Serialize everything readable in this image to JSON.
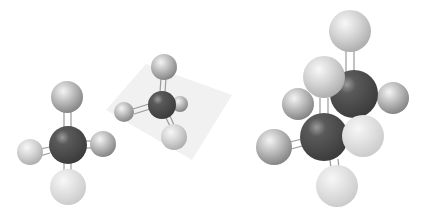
{
  "scene": {
    "description": "Ball-and-stick molecular models on white background",
    "background": "#ffffff",
    "colors": {
      "carbon": "#4a4a4a",
      "hydrogen": "#b5b5b5",
      "hydrogen_pale": "#dcdcdc",
      "bond": "#9a9a9a",
      "plane": "#efefef"
    },
    "molecules": [
      {
        "name": "methane-front-view",
        "atoms": [
          {
            "el": "H",
            "x": 67,
            "y": 97,
            "r": 16,
            "shade": "normal"
          },
          {
            "el": "H",
            "x": 30,
            "y": 152,
            "r": 13,
            "shade": "normal"
          },
          {
            "el": "H",
            "x": 103,
            "y": 144,
            "r": 13,
            "shade": "normal"
          },
          {
            "el": "H",
            "x": 68,
            "y": 187,
            "r": 18,
            "shade": "pale"
          },
          {
            "el": "C",
            "x": 68,
            "y": 145,
            "r": 19,
            "shade": "normal"
          }
        ]
      },
      {
        "name": "methane-on-plane",
        "atoms": [
          {
            "el": "H",
            "x": 180,
            "y": 104,
            "r": 8,
            "shade": "normal"
          },
          {
            "el": "H",
            "x": 164,
            "y": 67,
            "r": 13,
            "shade": "normal"
          },
          {
            "el": "H",
            "x": 124,
            "y": 112,
            "r": 10,
            "shade": "normal"
          },
          {
            "el": "C",
            "x": 162,
            "y": 105,
            "r": 14,
            "shade": "normal"
          },
          {
            "el": "H",
            "x": 174,
            "y": 137,
            "r": 13,
            "shade": "normal"
          }
        ]
      },
      {
        "name": "ethane",
        "atoms": [
          {
            "el": "H",
            "x": 350,
            "y": 31,
            "r": 21,
            "shade": "normal"
          },
          {
            "el": "H",
            "x": 393,
            "y": 98,
            "r": 16,
            "shade": "normal"
          },
          {
            "el": "C",
            "x": 354,
            "y": 94,
            "r": 24,
            "shade": "normal"
          },
          {
            "el": "H",
            "x": 298,
            "y": 104,
            "r": 16,
            "shade": "normal"
          },
          {
            "el": "H",
            "x": 324,
            "y": 77,
            "r": 21,
            "shade": "light"
          },
          {
            "el": "H",
            "x": 274,
            "y": 147,
            "r": 18,
            "shade": "normal"
          },
          {
            "el": "C",
            "x": 324,
            "y": 137,
            "r": 24,
            "shade": "normal"
          },
          {
            "el": "H",
            "x": 363,
            "y": 136,
            "r": 21,
            "shade": "pale"
          },
          {
            "el": "H",
            "x": 337,
            "y": 186,
            "r": 21,
            "shade": "pale"
          }
        ]
      }
    ]
  }
}
